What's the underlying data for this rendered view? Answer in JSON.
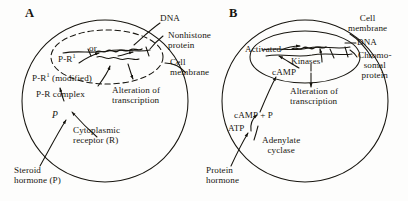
{
  "figure": {
    "background": "#fdfdfc",
    "ink": "#17150f"
  },
  "panels": [
    {
      "id": "A",
      "letter": "A",
      "name": "steroid-hormone-pathway",
      "labels": {
        "dna": "DNA",
        "nonhistone_protein": "Nonhistone\nprotein",
        "cell_membrane": "Cell\nmembrane",
        "or": "or",
        "pr1": "P-R",
        "pr1_sup": "1",
        "pr1_modified": "P-R",
        "pr1_modified_sup": "1",
        "pr1_modified_tail": " (modified)",
        "pr_complex": "P-R complex",
        "alteration": "Alteration of\ntranscription",
        "p_italic": "P",
        "cytoplasmic_receptor": "Cytoplasmic\nreceptor (R)",
        "steroid_hormone": "Steroid\nhormone (P)"
      }
    },
    {
      "id": "B",
      "letter": "B",
      "name": "protein-hormone-pathway",
      "labels": {
        "cell_membrane": "Cell\nmembrane",
        "dna": "DNA",
        "chromosomal_protein": "Chromo-\nsomal\nprotein",
        "activated": "Activated",
        "kinases": "Kinases",
        "camp": "cAMP",
        "alteration": "Alteration of\ntranscription",
        "camp_plus_p": "cAMP + P",
        "atp": "ATP",
        "adenylate_cyclase": "Adenylate\ncyclase",
        "protein_hormone": "Protein\nhormone"
      }
    }
  ]
}
